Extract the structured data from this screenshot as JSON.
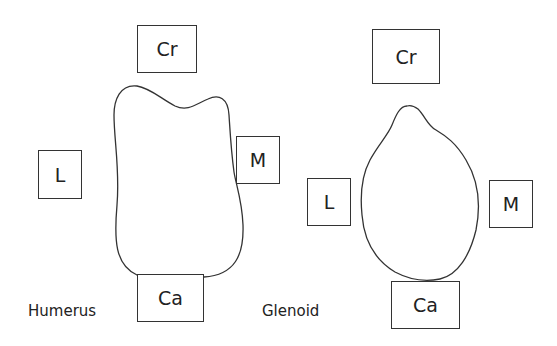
{
  "humerus": {
    "label": "Humerus",
    "directions": {
      "cranial": "Cr",
      "lateral": "L",
      "medial": "M",
      "caudal": "Ca"
    }
  },
  "glenoid": {
    "label": "Glenoid",
    "directions": {
      "cranial": "Cr",
      "lateral": "L",
      "medial": "M",
      "caudal": "Ca"
    }
  },
  "colors": {
    "stroke": "#333333",
    "text": "#222222",
    "background": "#ffffff"
  }
}
